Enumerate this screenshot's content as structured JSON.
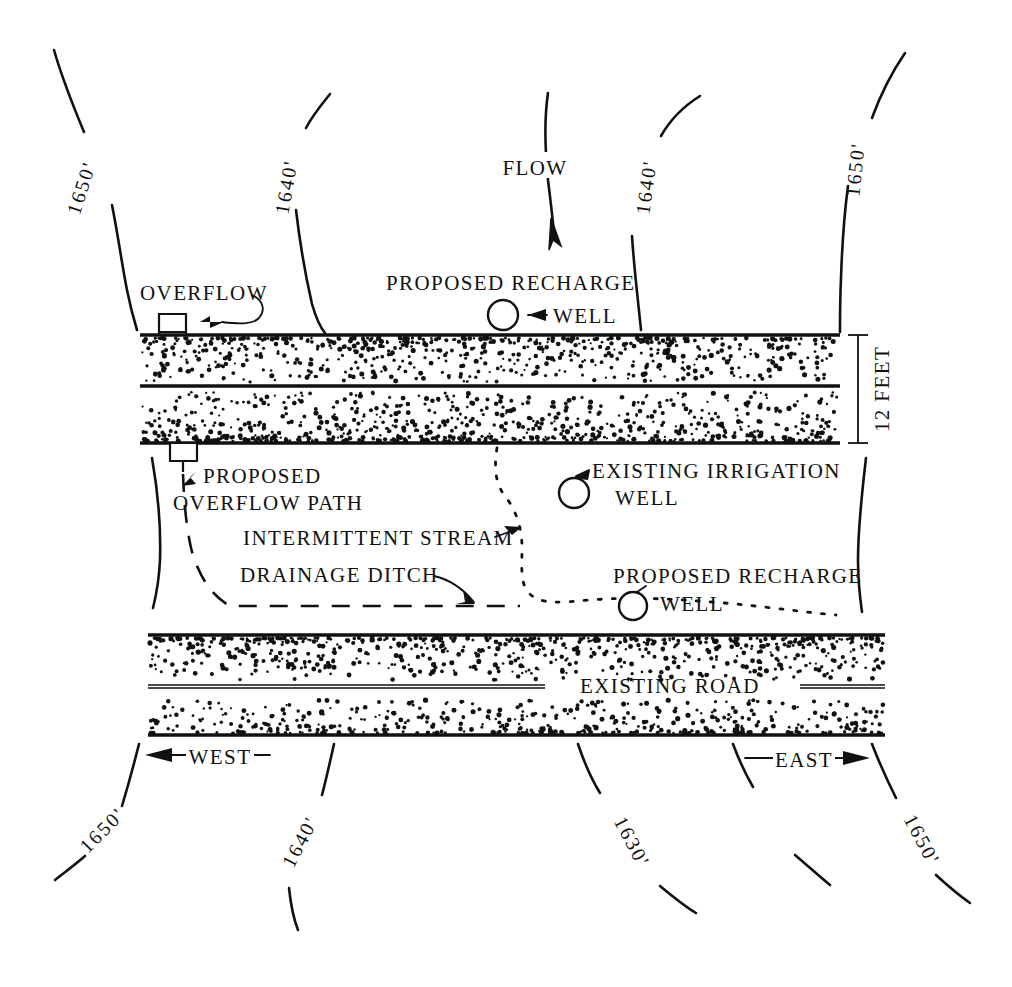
{
  "diagram": {
    "orientation": {
      "west_label": "WEST",
      "east_label": "EAST"
    },
    "flow": {
      "label": "FLOW"
    },
    "dimension": {
      "canal_width_label": "12 FEET"
    },
    "labels": {
      "overflow": "OVERFLOW",
      "proposed_recharge": "PROPOSED RECHARGE",
      "well": "WELL",
      "proposed_overflow_path_line1": "PROPOSED",
      "proposed_overflow_path_line2": "OVERFLOW PATH",
      "intermittent_stream": "INTERMITTENT STREAM",
      "drainage_ditch": "DRAINAGE DITCH",
      "existing_irrigation_line1": "EXISTING IRRIGATION",
      "existing_irrigation_line2": "WELL",
      "proposed_recharge_2": "PROPOSED RECHARGE",
      "well_2": "WELL",
      "existing_road": "EXISTING ROAD"
    },
    "contours_top": [
      {
        "name": "contour-1650-top-left",
        "value": "1650'"
      },
      {
        "name": "contour-1640-top-left",
        "value": "1640'"
      },
      {
        "name": "contour-1640-top-right",
        "value": "1640'"
      },
      {
        "name": "contour-1650-top-right",
        "value": "1650'"
      }
    ],
    "contours_bottom": [
      {
        "name": "contour-1650-bottom-left",
        "value": "1650'"
      },
      {
        "name": "contour-1640-bottom-left",
        "value": "1640'"
      },
      {
        "name": "contour-1630-bottom-right",
        "value": "1630'"
      },
      {
        "name": "contour-1650-bottom-right",
        "value": "1650'"
      }
    ],
    "colors": {
      "ink": "#111111",
      "paper": "#ffffff"
    }
  }
}
